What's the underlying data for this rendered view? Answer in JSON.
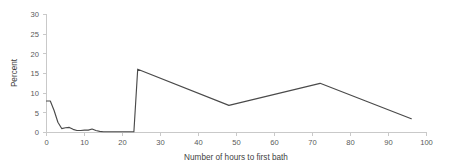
{
  "chart_data": {
    "type": "line",
    "title": "",
    "xlabel": "Number of hours to first bath",
    "ylabel": "Percent",
    "xlim": [
      0,
      100
    ],
    "ylim": [
      0,
      30
    ],
    "xticks": [
      0,
      10,
      20,
      30,
      40,
      50,
      60,
      70,
      80,
      90,
      100
    ],
    "yticks": [
      0,
      5,
      10,
      15,
      20,
      25,
      30
    ],
    "xtick_labels": [
      "0",
      "10",
      "20",
      "30",
      "40",
      "50",
      "60",
      "70",
      "80",
      "90",
      "100"
    ],
    "ytick_labels": [
      "0",
      "5",
      "10",
      "15",
      "20",
      "25",
      "30"
    ],
    "grid": false,
    "legend": null,
    "series": [
      {
        "name": "Percent of newborns",
        "color": "#4a4a4a",
        "x": [
          0,
          1,
          2,
          3,
          4,
          5,
          6,
          7,
          8,
          9,
          10,
          11,
          12,
          13,
          14,
          15,
          16,
          17,
          18,
          19,
          20,
          21,
          22,
          23,
          24,
          48,
          72,
          96
        ],
        "values": [
          8.0,
          8.0,
          5.6,
          2.6,
          1.0,
          1.2,
          1.3,
          0.8,
          0.5,
          0.5,
          0.6,
          0.6,
          0.9,
          0.5,
          0.3,
          0.2,
          0.2,
          0.2,
          0.2,
          0.2,
          0.2,
          0.2,
          0.2,
          0.2,
          16.1,
          6.9,
          12.5,
          3.5
        ]
      }
    ]
  },
  "axis": {
    "y_title": "Percent",
    "x_title": "Number of hours to first bath"
  }
}
